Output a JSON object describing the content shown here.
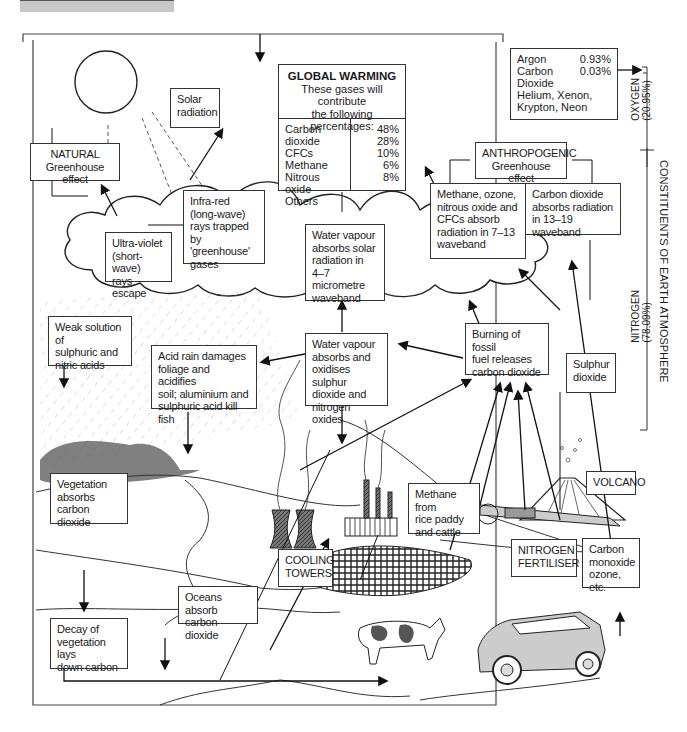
{
  "diagram": {
    "side_label": "CONSTITUENTS OF EARTH ATMOSPHERE",
    "oxygen": {
      "name": "OXYGEN",
      "pct": "(20.95%)"
    },
    "nitrogen": {
      "name": "NITROGEN",
      "pct": "(78.09%)"
    },
    "trace_gases": {
      "rows": [
        {
          "name": "Argon",
          "value": "0.93%"
        },
        {
          "name": "Carbon Dioxide",
          "value": "0.03%"
        },
        {
          "name": "Helium, Xenon,",
          "value": ""
        },
        {
          "name": "Krypton, Neon",
          "value": ""
        }
      ]
    },
    "global_warming": {
      "title": "GLOBAL WARMING",
      "subtitle_1": "These gases will contribute",
      "subtitle_2": "the following percentages:",
      "gases": [
        {
          "name": "Carbon dioxide",
          "pct": "48%"
        },
        {
          "name": "CFCs",
          "pct": "28%"
        },
        {
          "name": "Methane",
          "pct": "10%"
        },
        {
          "name": "Nitrous oxide",
          "pct": "6%"
        },
        {
          "name": "Others",
          "pct": "8%"
        }
      ]
    },
    "labels": {
      "solar_radiation": [
        "Solar",
        "radiation"
      ],
      "natural": [
        "NATURAL",
        "Greenhouse effect"
      ],
      "infra_red": [
        "Infra-red",
        "(long-wave)",
        "rays trapped by",
        "'greenhouse'",
        "gases"
      ],
      "ultra_violet": [
        "Ultra-violet",
        "(short-wave)",
        "rays escape"
      ],
      "anthropogenic": [
        "ANTHROPOGENIC",
        "Greenhouse effect"
      ],
      "methane_ozone": [
        "Methane, ozone,",
        "nitrous oxide and",
        "CFCs absorb",
        "radiation in 7–13",
        "waveband"
      ],
      "co2_absorbs": [
        "Carbon dioxide",
        "absorbs radiation",
        "in 13–19 waveband"
      ],
      "water_vapour_solar": [
        "Water vapour",
        "absorbs solar",
        "radiation in 4–7",
        "micrometre",
        "waveband"
      ],
      "weak_solution": [
        "Weak solution of",
        "sulphuric and",
        "nitric acids"
      ],
      "acid_rain": [
        "Acid rain damages",
        "foliage and acidifies",
        "soil; aluminium and",
        "sulphuric acid kill fish"
      ],
      "water_vapour_oxidises": [
        "Water vapour",
        "absorbs and",
        "oxidises sulphur",
        "dioxide and",
        "nitrogen oxides"
      ],
      "burning_fossil": [
        "Burning of fossil",
        "fuel  releases",
        "carbon dioxide"
      ],
      "sulphur_dioxide": [
        "Sulphur",
        "dioxide"
      ],
      "vegetation_absorbs": [
        "Vegetation",
        "absorbs carbon",
        "dioxide"
      ],
      "methane_rice": [
        "Methane from",
        "rice paddy",
        "and cattle"
      ],
      "volcano": [
        "VOLCANO"
      ],
      "cooling_towers": [
        "COOLING",
        "TOWERS"
      ],
      "nitrogen_fertiliser": [
        "NITROGEN",
        "FERTILISER"
      ],
      "carbon_monoxide": [
        "Carbon",
        "monoxide",
        "ozone, etc."
      ],
      "oceans_absorb": [
        "Oceans absorb",
        "carbon dioxide"
      ],
      "decay_vegetation": [
        "Decay of",
        "vegetation lays",
        "down carbon"
      ]
    }
  }
}
